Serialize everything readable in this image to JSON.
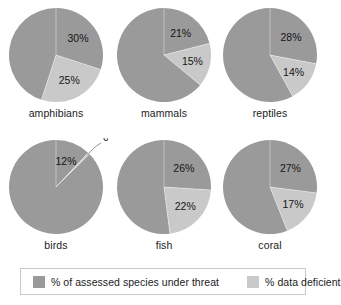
{
  "chart_data": {
    "type": "pie",
    "title": "",
    "legend_position": "bottom",
    "series_names": [
      "% of assessed species under threat",
      "% data deficient"
    ],
    "colors": {
      "threat": "#9a9a9a",
      "deficient": "#c9c9c9",
      "remainder": "#9a9a9a",
      "background": "#ffffff",
      "label_text": "#151515",
      "legend_border": "#c9c9c9",
      "leader_line": "#8a8a8a"
    },
    "charts": [
      {
        "name": "amphibians",
        "label": "amphibians",
        "threat_pct": 30,
        "deficient_pct": 25,
        "threat_label": "30%",
        "deficient_label": "25%",
        "callout": false
      },
      {
        "name": "mammals",
        "label": "mammals",
        "threat_pct": 21,
        "deficient_pct": 15,
        "threat_label": "21%",
        "deficient_label": "15%",
        "callout": false
      },
      {
        "name": "reptiles",
        "label": "reptiles",
        "threat_pct": 28,
        "deficient_pct": 14,
        "threat_label": "28%",
        "deficient_label": "14%",
        "callout": false
      },
      {
        "name": "birds",
        "label": "birds",
        "threat_pct": 12,
        "deficient_pct": 0.6,
        "threat_label": "12%",
        "deficient_label": "0.6%",
        "callout": true
      },
      {
        "name": "fish",
        "label": "fish",
        "threat_pct": 26,
        "deficient_pct": 22,
        "threat_label": "26%",
        "deficient_label": "22%",
        "callout": false
      },
      {
        "name": "coral",
        "label": "coral",
        "threat_pct": 27,
        "deficient_pct": 17,
        "threat_label": "27%",
        "deficient_label": "17%",
        "callout": false
      }
    ]
  },
  "legend": {
    "threat_label": "% of assessed species under threat",
    "deficient_label": "% data deficient"
  }
}
